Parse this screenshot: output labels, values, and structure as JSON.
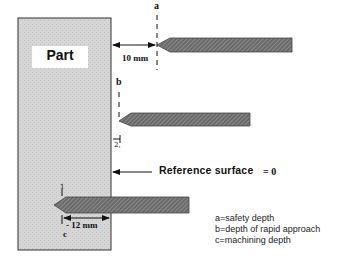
{
  "part": {
    "label": "Part"
  },
  "labels": {
    "a": "a",
    "b": "b",
    "c": "c",
    "dim_a": "10 mm",
    "dim_c": "- 12 mm",
    "z_tick": "2,",
    "tick_c": "1"
  },
  "reference": {
    "label": "Reference surface",
    "value": "= 0"
  },
  "legend": [
    {
      "text": "a=safety depth"
    },
    {
      "text": "b=depth of rapid approach"
    },
    {
      "text": "c=machining depth"
    }
  ],
  "colors": {
    "part_fill": "#d4d4d4",
    "tool_fill": "#6e6e6e",
    "line": "#111111"
  }
}
